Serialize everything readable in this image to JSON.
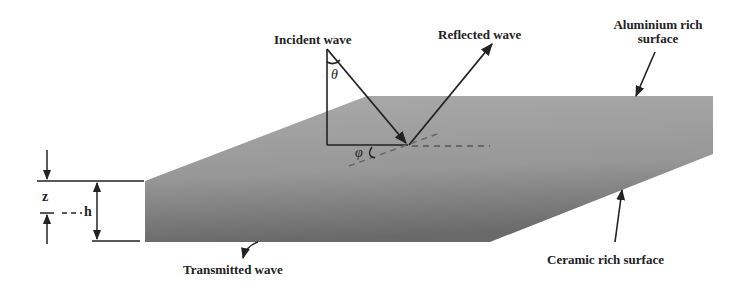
{
  "labels": {
    "incident": "Incident wave",
    "reflected": "Reflected wave",
    "aluminium_line1": "Aluminium rich",
    "aluminium_line2": "surface",
    "ceramic": "Ceramic rich surface",
    "transmitted": "Transmitted wave"
  },
  "symbols": {
    "theta": "θ",
    "phi": "φ",
    "z": "z",
    "h": "h"
  },
  "colors": {
    "slab_light": "#a8a8a8",
    "slab_dark": "#6e6e6e",
    "line": "#222222"
  }
}
